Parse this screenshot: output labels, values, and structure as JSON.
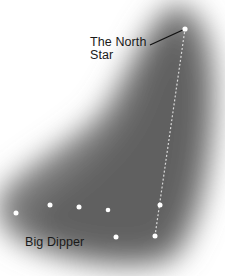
{
  "diagram": {
    "labels": {
      "north_star_line1": "The North",
      "north_star_line2": "Star",
      "big_dipper": "Big Dipper"
    },
    "colors": {
      "background": "#ffffff",
      "sky_dark": "#6e6e6e",
      "star": "#ffffff",
      "text": "#1a1a1a",
      "pointer_line": "#111111"
    },
    "stars": [
      {
        "name": "north-star",
        "x": 185,
        "y": 29
      },
      {
        "name": "dubhe",
        "x": 160,
        "y": 205
      },
      {
        "name": "merak",
        "x": 155,
        "y": 236
      },
      {
        "name": "phecda",
        "x": 116,
        "y": 237
      },
      {
        "name": "megrez",
        "x": 108,
        "y": 210
      },
      {
        "name": "alioth",
        "x": 79,
        "y": 207
      },
      {
        "name": "mizar",
        "x": 50,
        "y": 205
      },
      {
        "name": "alkaid",
        "x": 16,
        "y": 213
      }
    ]
  }
}
